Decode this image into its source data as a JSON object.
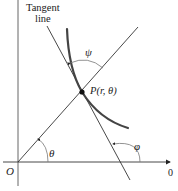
{
  "labels": {
    "tangent_line_1": "Tangent",
    "tangent_line_2": "line",
    "psi": "ψ",
    "point": "P(r, θ)",
    "theta": "θ",
    "phi": "φ",
    "origin": "O",
    "polar_axis": "0"
  },
  "colors": {
    "line": "#333333",
    "curve": "#444444",
    "arc": "#666666",
    "text": "#222222"
  }
}
